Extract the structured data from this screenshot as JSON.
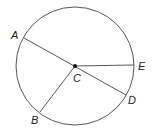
{
  "diagram": {
    "type": "circle-geometry",
    "center": {
      "label": "C"
    },
    "points": [
      {
        "label": "A"
      },
      {
        "label": "B"
      },
      {
        "label": "D"
      },
      {
        "label": "E"
      }
    ],
    "segments": [
      "AD",
      "CB",
      "CE"
    ],
    "colors": {
      "stroke": "#333333",
      "text": "#222222"
    }
  }
}
